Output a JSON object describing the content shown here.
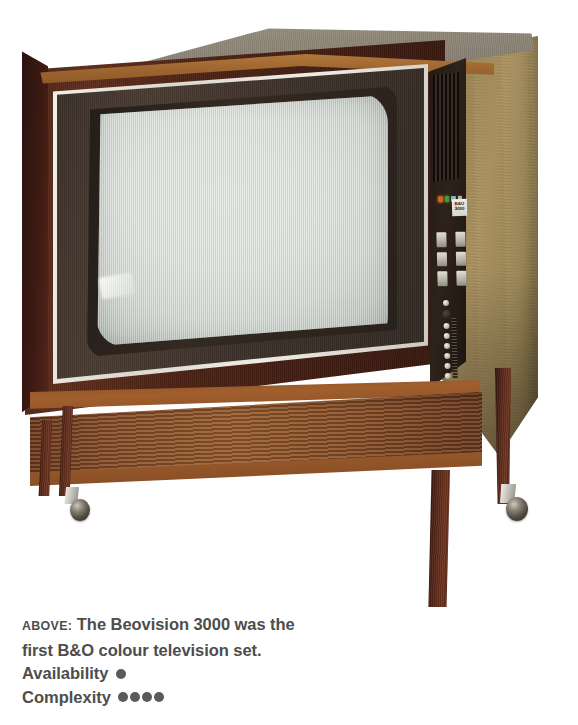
{
  "background_color": "#ffffff",
  "caption": {
    "prefix": "ABOVE:",
    "line1": "The Beovision 3000 was the",
    "line2": "first B&O colour television set.",
    "availability_label": "Availability",
    "availability_rating": 1,
    "complexity_label": "Complexity",
    "complexity_rating": 4,
    "text_color": "#4d4d4d",
    "dot_color": "#5a5a5a"
  },
  "photo": {
    "subject": "Bang & Olufsen Beovision 3000 colour television console on wheeled stand",
    "badge_text": "B&O\n3000",
    "badge_line1": "B&O",
    "badge_line2": "3000",
    "colors": {
      "cabinet_rosewood": "#4a2214",
      "side_panel_light": "#ab9260",
      "cabinet_top": "#8f8879",
      "speaker_grille": "#9a5c2e",
      "screen_glass": "#dfe3de",
      "bezel_dark": "#3d322a",
      "chrome_trim": "#efece5",
      "caster_metal": "#8b8478"
    },
    "controls": {
      "indicator_count": 4,
      "button_count": 6,
      "knob_count": 8
    }
  }
}
